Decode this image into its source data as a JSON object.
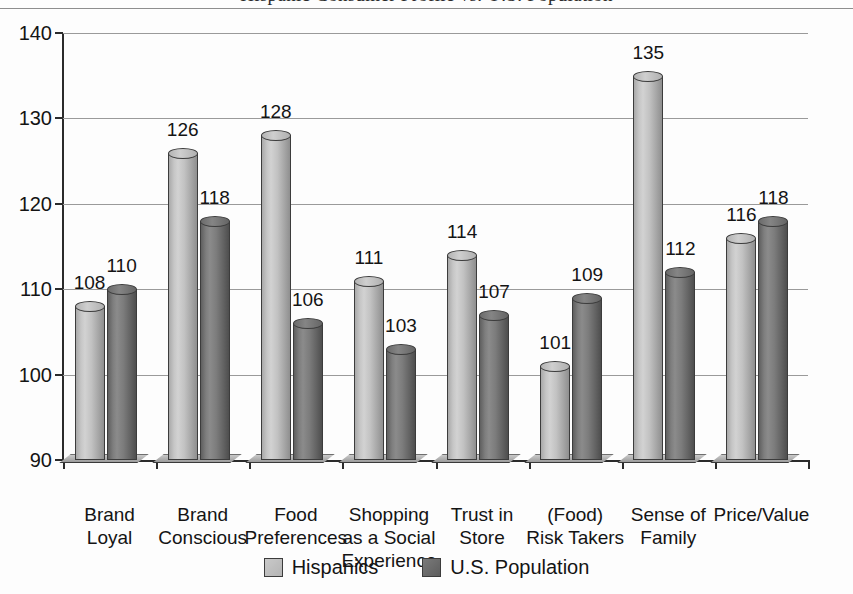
{
  "figure": {
    "title_fragment": "Hispanic Consumer Profile vs. U.S. Population",
    "accent_light": "#c2c2c2",
    "accent_dark": "#6f6f6f"
  },
  "chart_data": {
    "type": "bar",
    "title": "",
    "xlabel": "",
    "ylabel": "",
    "ylim": [
      90,
      140
    ],
    "yticks": [
      90,
      100,
      110,
      120,
      130,
      140
    ],
    "grid": true,
    "legend_position": "bottom",
    "categories": [
      "Brand\nLoyal",
      "Brand\nConscious",
      "Food\nPreferences",
      "Shopping\nas a Social\nExperience",
      "Trust in\nStore",
      "(Food)\nRisk Takers",
      "Sense of\nFamily",
      "Price/Value"
    ],
    "series": [
      {
        "name": "Hispanics",
        "color": "#c2c2c2",
        "values": [
          108,
          126,
          128,
          111,
          114,
          101,
          135,
          116
        ]
      },
      {
        "name": "U.S. Population",
        "color": "#6f6f6f",
        "values": [
          110,
          118,
          106,
          103,
          107,
          109,
          112,
          118
        ]
      }
    ]
  }
}
